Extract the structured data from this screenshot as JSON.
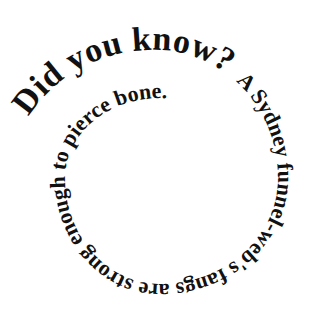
{
  "image": {
    "background": "#ffffff",
    "text_color": "#111111",
    "title": "Did you know?",
    "fact": "A Sydney funnel-web's fangs are strong enough to pierce bone."
  }
}
